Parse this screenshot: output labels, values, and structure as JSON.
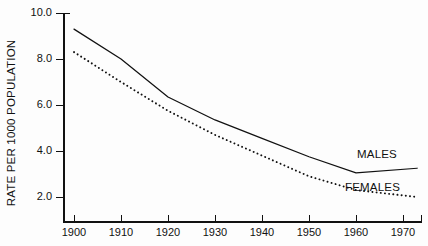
{
  "chart_data": {
    "type": "line",
    "title": "",
    "xlabel": "",
    "ylabel": "RATE PER 1000 POPULATION",
    "xlim": [
      1898,
      1974
    ],
    "ylim": [
      1.0,
      10.0
    ],
    "grid": false,
    "legend_position": "inline-right",
    "x": [
      1900,
      1910,
      1920,
      1930,
      1940,
      1950,
      1960,
      1973
    ],
    "xticks": [
      1900,
      1910,
      1920,
      1930,
      1940,
      1950,
      1960,
      1970
    ],
    "xtick_labels": [
      "1900",
      "1910",
      "1920",
      "1930",
      "1940",
      "1950",
      "1960",
      "1970"
    ],
    "yticks": [
      2.0,
      4.0,
      6.0,
      8.0,
      10.0
    ],
    "ytick_labels": [
      "2.0",
      "4.0",
      "6.0",
      "8.0",
      "10.0"
    ],
    "series": [
      {
        "name": "MALES",
        "style": "solid",
        "color": "#111111",
        "values": [
          9.3,
          8.0,
          6.35,
          5.35,
          4.55,
          3.75,
          3.05,
          3.25
        ]
      },
      {
        "name": "FEMALES",
        "style": "dotted",
        "color": "#111111",
        "values": [
          8.3,
          7.0,
          5.75,
          4.7,
          3.8,
          2.9,
          2.3,
          2.0
        ]
      }
    ],
    "annotations": [
      {
        "text": "MALES",
        "x": 1970,
        "y": 3.95
      },
      {
        "text": "FEMALES",
        "x": 1968,
        "y": 2.6
      }
    ]
  },
  "axes": {
    "y_title": "RATE PER 1000 POPULATION"
  }
}
